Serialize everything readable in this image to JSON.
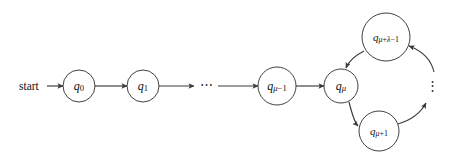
{
  "figure": {
    "name": "state-machine-rho-shape",
    "background_color": "#ffffff",
    "line_color": "#3a3a3a",
    "label_color": "#111111",
    "start_label": "start",
    "horizontal_ellipsis": "⋯",
    "vertical_ellipsis": "⋮"
  },
  "nodes": [
    {
      "id": "q0",
      "base": "q",
      "subscript": "0",
      "label": "q0",
      "cx": 79,
      "cy": 86,
      "r": 16,
      "font_size": 12
    },
    {
      "id": "q1",
      "base": "q",
      "subscript": "1",
      "label": "q1",
      "cx": 143,
      "cy": 86,
      "r": 16,
      "font_size": 12
    },
    {
      "id": "qmu_minus_1",
      "base": "q",
      "subscript": "μ−1",
      "label": "qμ−1",
      "cx": 277,
      "cy": 86,
      "r": 19,
      "font_size": 12
    },
    {
      "id": "qmu",
      "base": "q",
      "subscript": "μ",
      "label": "qμ",
      "cx": 341,
      "cy": 86,
      "r": 17,
      "font_size": 12
    },
    {
      "id": "qmu_plus_lambda_minus_1",
      "base": "q",
      "subscript": "μ+λ−1",
      "label": "qμ+λ−1",
      "cx": 386,
      "cy": 37,
      "r": 24,
      "font_size": 11
    },
    {
      "id": "qmu_plus_1",
      "base": "q",
      "subscript": "μ+1",
      "label": "qμ+1",
      "cx": 379,
      "cy": 131,
      "r": 20,
      "font_size": 11
    }
  ],
  "edges": [
    {
      "id": "start-to-q0",
      "from": "start",
      "to": "q0",
      "kind": "straight"
    },
    {
      "id": "q0-to-q1",
      "from": "q0",
      "to": "q1",
      "kind": "straight"
    },
    {
      "id": "q1-to-dots",
      "from": "q1",
      "to": "ellipsis",
      "kind": "straight"
    },
    {
      "id": "dots-to-qmu-minus-1",
      "from": "ellipsis",
      "to": "qmu_minus_1",
      "kind": "straight"
    },
    {
      "id": "qmu-minus-1-to-qmu",
      "from": "qmu_minus_1",
      "to": "qmu",
      "kind": "straight"
    },
    {
      "id": "qmu-to-qmu-plus-1",
      "from": "qmu",
      "to": "qmu_plus_1",
      "kind": "arc"
    },
    {
      "id": "qmu-plus-1-to-vdots",
      "from": "qmu_plus_1",
      "to": "vertical_ellipsis",
      "kind": "arc"
    },
    {
      "id": "vdots-to-qmu-plus-lambda-minus-1",
      "from": "vertical_ellipsis",
      "to": "qmu_plus_lambda_minus_1",
      "kind": "arc"
    },
    {
      "id": "qmu-plus-lambda-minus-1-to-qmu",
      "from": "qmu_plus_lambda_minus_1",
      "to": "qmu",
      "kind": "arc"
    }
  ],
  "ellipses": {
    "horizontal": {
      "x": 206,
      "y": 86,
      "glyph": "⋯"
    },
    "vertical": {
      "x": 432,
      "y": 87,
      "glyph": "⋮"
    }
  },
  "start": {
    "text_x": 20,
    "text_y": 86,
    "arrow_from_x": 47,
    "arrow_to_x": 62,
    "y": 86
  }
}
